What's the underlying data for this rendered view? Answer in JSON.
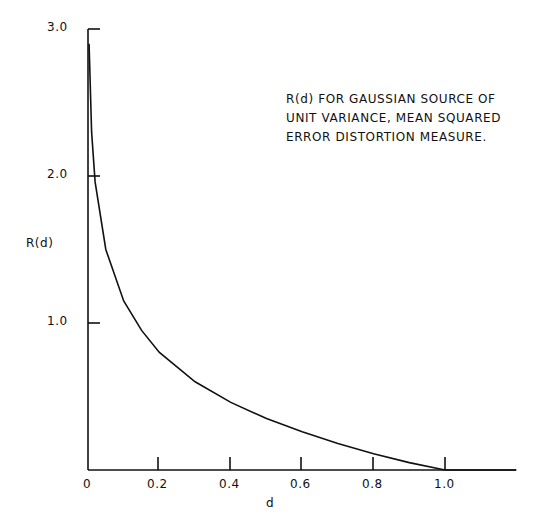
{
  "chart_data": {
    "type": "line",
    "title": "",
    "annotation": [
      "R(d) FOR GAUSSIAN SOURCE OF",
      "UNIT VARIANCE, MEAN SQUARED",
      "ERROR DISTORTION MEASURE."
    ],
    "xlabel": "d",
    "ylabel": "R(d)",
    "xlim": [
      0,
      1.2
    ],
    "ylim": [
      0,
      3.0
    ],
    "x_ticks": [
      "0",
      "0.2",
      "0.4",
      "0.6",
      "0.8",
      "1.0"
    ],
    "y_ticks": [
      "1.0",
      "2.0",
      "3.0"
    ],
    "grid": false,
    "legend": null,
    "series": [
      {
        "name": "R(d) = 1/2 ln(1/d)",
        "x": [
          0.003,
          0.01,
          0.02,
          0.05,
          0.1,
          0.15,
          0.2,
          0.3,
          0.4,
          0.5,
          0.6,
          0.7,
          0.8,
          0.9,
          1.0,
          1.2
        ],
        "values": [
          2.9,
          2.3,
          1.96,
          1.5,
          1.15,
          0.95,
          0.8,
          0.6,
          0.46,
          0.35,
          0.26,
          0.18,
          0.11,
          0.05,
          0.0,
          0.0
        ]
      }
    ]
  }
}
